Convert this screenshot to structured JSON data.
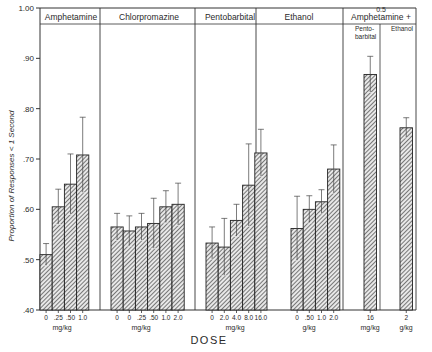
{
  "chart_data": {
    "type": "bar",
    "title": "",
    "xlabel": "DOSE",
    "ylabel": "Proportion of Responses < 1 Second",
    "ylim": [
      0.4,
      1.0
    ],
    "yticks": [
      ".40",
      ".50",
      ".60",
      ".70",
      ".80",
      ".90",
      "1.00"
    ],
    "grid": false,
    "groups": [
      {
        "name": "Amphetamine",
        "unit": "mg/kg",
        "categories": [
          "0",
          ".25",
          ".50",
          "1.0"
        ],
        "values": [
          0.51,
          0.605,
          0.65,
          0.708
        ],
        "errors": [
          0.022,
          0.035,
          0.06,
          0.075
        ]
      },
      {
        "name": "Chlorpromazine",
        "unit": "mg/kg",
        "categories": [
          "0",
          "0",
          ".25",
          ".50",
          "1.0",
          "2.0"
        ],
        "values": [
          0.565,
          0.557,
          0.565,
          0.572,
          0.605,
          0.61
        ],
        "errors": [
          0.027,
          0.03,
          0.027,
          0.05,
          0.032,
          0.042
        ]
      },
      {
        "name": "Pentobarbital",
        "unit": "mg/kg",
        "categories": [
          "0",
          "2.0",
          "4.0",
          "8.0",
          "16.0"
        ],
        "values": [
          0.533,
          0.525,
          0.578,
          0.648,
          0.712
        ],
        "errors": [
          0.032,
          0.057,
          0.032,
          0.082,
          0.047
        ]
      },
      {
        "name": "Ethanol",
        "unit": "g/kg",
        "categories": [
          "0",
          ".50",
          "1.0",
          "2.0"
        ],
        "values": [
          0.562,
          0.6,
          0.615,
          0.68
        ],
        "errors": [
          0.064,
          0.027,
          0.024,
          0.048
        ]
      },
      {
        "name": "0.5 Amphetamine + Pentobarbital",
        "unit": "mg/kg",
        "categories": [
          "16"
        ],
        "values": [
          0.868
        ],
        "errors": [
          0.036
        ]
      },
      {
        "name": "0.5 Amphetamine + Ethanol",
        "unit": "g/kg",
        "categories": [
          "2"
        ],
        "values": [
          0.762
        ],
        "errors": [
          0.02
        ]
      }
    ]
  },
  "labels": {
    "header_amph": "Amphetamine",
    "header_chlor": "Chlorpromazine",
    "header_pento": "Pentobarbital",
    "header_eth": "Ethanol",
    "header_combo_dose": "0.5",
    "header_combo": "Amphetamine +",
    "sub_pento_1": "Pento-",
    "sub_pento_2": "barbital",
    "sub_eth": "Ethanol",
    "ylabel": "Proportion of Responses < 1 Second",
    "xlabel": "DOSE",
    "unit_amph": "mg/kg",
    "unit_chlor": "mg/kg",
    "unit_pento": "mg/kg",
    "unit_eth": "g/kg",
    "unit_combo_pento": "mg/kg",
    "unit_combo_eth": "g/kg"
  }
}
